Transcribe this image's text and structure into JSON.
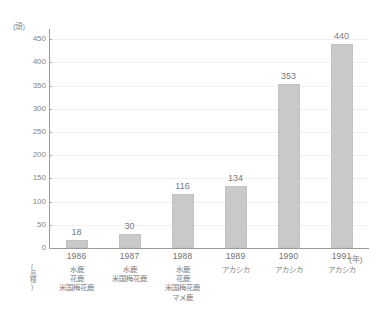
{
  "top_caption": "",
  "axes": {
    "y_unit_label": "(頭)",
    "x_unit_label": "(年)",
    "corner_label": "(品種)",
    "y_ticks": [
      0,
      50,
      100,
      150,
      200,
      250,
      300,
      350,
      400,
      450
    ]
  },
  "chart_data": {
    "type": "bar",
    "title": "",
    "xlabel": "(年)",
    "ylabel": "(頭)",
    "ylim": [
      0,
      470
    ],
    "grid": true,
    "legend": "none",
    "categories": [
      "1986",
      "1987",
      "1988",
      "1989",
      "1990",
      "1991"
    ],
    "values": [
      18,
      30,
      116,
      134,
      353,
      440
    ],
    "value_labels": [
      "18",
      "30",
      "116",
      "134",
      "353",
      "440"
    ],
    "tick_labels": [
      "0",
      "50",
      "100",
      "150",
      "200",
      "250",
      "300",
      "350",
      "400",
      "450"
    ],
    "category_sublabels": [
      [
        "水鹿",
        "花鹿",
        "米国梅花鹿"
      ],
      [
        "水鹿",
        "米国梅花鹿"
      ],
      [
        "水鹿",
        "花鹿",
        "米国梅花鹿",
        "マメ鹿"
      ],
      [
        "アカシカ"
      ],
      [
        "アカシカ"
      ],
      [
        "アカシカ"
      ]
    ],
    "bar_color": "#c9c9c9",
    "grid_color": "#f0f0f0",
    "axis_color": "#9a9a9a",
    "text_color": "#7d7d7d"
  }
}
